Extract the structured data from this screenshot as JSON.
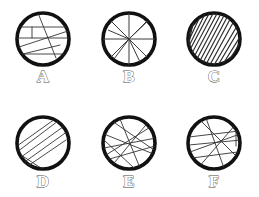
{
  "figure": {
    "background_color": "#ffffff",
    "outline_color": "#111111",
    "line_color": "#333333",
    "label_color": "#4a4a4a",
    "width": 259,
    "height": 197,
    "rows": 2,
    "columns": 3
  },
  "panels": [
    {
      "id": "panel-a",
      "label": "A",
      "pattern": "horizontal-chords-with-diagonals",
      "center": {
        "x": 43,
        "y": 39
      },
      "radius": 28,
      "label_position": {
        "x": 43,
        "y": 82
      },
      "line_count": 7
    },
    {
      "id": "panel-b",
      "label": "B",
      "pattern": "radial-spokes-wheel",
      "center": {
        "x": 129,
        "y": 39
      },
      "radius": 28,
      "label_position": {
        "x": 129,
        "y": 82
      },
      "line_count": 8
    },
    {
      "id": "panel-c",
      "label": "C",
      "pattern": "dense-diagonal-hatching",
      "center": {
        "x": 214,
        "y": 39
      },
      "radius": 28,
      "label_position": {
        "x": 214,
        "y": 82
      },
      "line_count": 22
    },
    {
      "id": "panel-d",
      "label": "D",
      "pattern": "near-parallel-diagonal-chords",
      "center": {
        "x": 43,
        "y": 143
      },
      "radius": 28,
      "label_position": {
        "x": 43,
        "y": 187
      },
      "line_count": 7
    },
    {
      "id": "panel-e",
      "label": "E",
      "pattern": "crossing-chord-web",
      "center": {
        "x": 129,
        "y": 143
      },
      "radius": 28,
      "label_position": {
        "x": 129,
        "y": 187
      },
      "line_count": 8
    },
    {
      "id": "panel-f",
      "label": "F",
      "pattern": "mixed-crossing-chords",
      "center": {
        "x": 214,
        "y": 143
      },
      "radius": 28,
      "label_position": {
        "x": 214,
        "y": 187
      },
      "line_count": 8
    }
  ]
}
